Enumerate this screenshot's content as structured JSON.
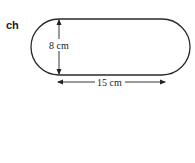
{
  "question_label": "ch",
  "figure": {
    "shape": "stadium (rectangle with semicircular ends)",
    "height_label": "8 cm",
    "length_label": "15 cm",
    "stroke_color": "#2a2a2a"
  }
}
